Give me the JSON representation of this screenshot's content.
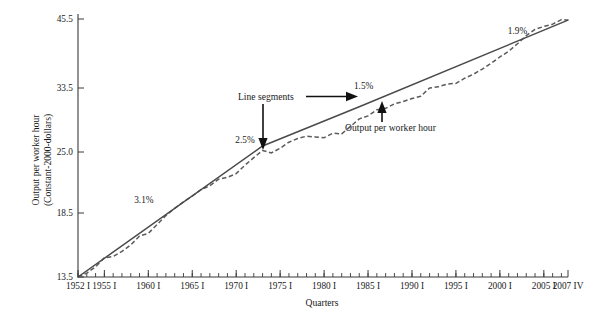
{
  "chart_data": {
    "type": "line",
    "title": "",
    "xlabel": "Quarters",
    "ylabel_line1": "Output per worker hour",
    "ylabel_line2": "(Constant-2000-dollars)",
    "grid": false,
    "legend_position": "none",
    "ylim": [
      13.5,
      45.5
    ],
    "xlim": [
      "1952 I",
      "2007 IV"
    ],
    "ytick_labels": [
      "45.5",
      "33.5",
      "25.0",
      "18.5",
      "13.5"
    ],
    "ytick_values": [
      45.5,
      33.5,
      25.0,
      18.5,
      13.5
    ],
    "xtick_labels": [
      "1952 I",
      "1955 I",
      "1960 I",
      "1965 I",
      "1970 I",
      "1975 I",
      "1980 I",
      "1985 I",
      "1990 I",
      "1995 I",
      "2000 I",
      "2005 I",
      "2007 IV"
    ],
    "xtick_years": [
      1952,
      1955,
      1960,
      1965,
      1970,
      1975,
      1980,
      1985,
      1990,
      1995,
      2000,
      2005,
      2007.75
    ],
    "annotations": [
      {
        "name": "growth-rate-segment-1",
        "text": "3.1%",
        "x": 1959.5,
        "y": 19.6
      },
      {
        "name": "growth-rate-segment-2",
        "text": "2.5%",
        "x": 1971.0,
        "y": 26.2
      },
      {
        "name": "growth-rate-segment-3",
        "text": "1.5%",
        "x": 1984.5,
        "y": 33.4
      },
      {
        "name": "growth-rate-segment-4",
        "text": "1.9%",
        "x": 2002.0,
        "y": 42.9
      },
      {
        "name": "line-segments-callout",
        "text": "Line segments"
      },
      {
        "name": "output-per-worker-hour-callout",
        "text": "Output per worker hour"
      }
    ],
    "series": [
      {
        "name": "Line segments",
        "style": "solid",
        "breakpoints_x": [
          1952.0,
          1973.0,
          1984.0,
          2007.75
        ],
        "breakpoints_y": [
          13.5,
          25.8,
          31.0,
          45.3
        ],
        "segment_growth_rates": [
          "3.1%",
          "2.5%",
          "1.5%",
          "1.9%"
        ]
      },
      {
        "name": "Output per worker hour",
        "style": "dashed",
        "x": [
          1952.0,
          1953.0,
          1954.0,
          1955.0,
          1956.0,
          1957.0,
          1958.0,
          1959.0,
          1960.0,
          1961.0,
          1962.0,
          1963.0,
          1964.0,
          1965.0,
          1966.0,
          1967.0,
          1968.0,
          1969.0,
          1970.0,
          1971.0,
          1972.0,
          1973.0,
          1974.0,
          1975.0,
          1976.0,
          1977.0,
          1978.0,
          1979.0,
          1980.0,
          1981.0,
          1982.0,
          1983.0,
          1984.0,
          1985.0,
          1986.0,
          1987.0,
          1988.0,
          1989.0,
          1990.0,
          1991.0,
          1992.0,
          1993.0,
          1994.0,
          1995.0,
          1996.0,
          1997.0,
          1998.0,
          1999.0,
          2000.0,
          2001.0,
          2002.0,
          2003.0,
          2004.0,
          2005.0,
          2006.0,
          2007.0,
          2007.75
        ],
        "y": [
          13.5,
          13.8,
          14.3,
          15.0,
          15.1,
          15.5,
          16.0,
          16.7,
          16.9,
          17.6,
          18.3,
          19.0,
          19.7,
          20.3,
          21.0,
          21.4,
          22.1,
          22.3,
          22.7,
          23.6,
          24.4,
          25.2,
          24.9,
          25.5,
          26.3,
          26.8,
          27.1,
          27.0,
          26.9,
          27.5,
          27.4,
          28.4,
          29.4,
          29.8,
          30.6,
          30.8,
          31.4,
          31.7,
          32.1,
          32.4,
          33.5,
          33.7,
          34.2,
          34.3,
          35.2,
          35.9,
          36.8,
          37.8,
          38.9,
          39.9,
          41.2,
          42.6,
          43.7,
          44.2,
          44.6,
          45.4,
          45.3
        ]
      }
    ]
  },
  "colors": {
    "trendline": "#4a4a4a",
    "dataline": "#5b5b5b",
    "axis": "#3a3a3a",
    "text": "#1a1a1a",
    "background": "#ffffff"
  }
}
